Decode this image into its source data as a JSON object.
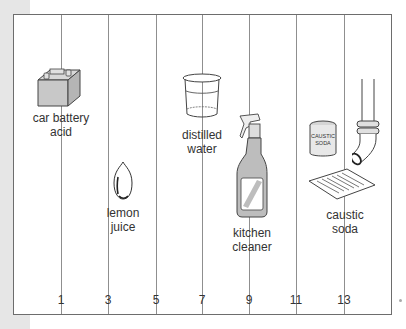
{
  "scale": {
    "ticks": [
      "1",
      "3",
      "5",
      "7",
      "9",
      "11",
      "13"
    ],
    "tick_x": [
      60,
      107,
      155,
      201,
      248,
      295,
      343
    ]
  },
  "items": [
    {
      "name": "car-battery-acid",
      "icon": "battery-icon",
      "label_line1": "car battery",
      "label_line2": "acid",
      "ph": 1
    },
    {
      "name": "lemon-juice",
      "icon": "lemon-icon",
      "label_line1": "lemon",
      "label_line2": "juice",
      "ph": 3
    },
    {
      "name": "distilled-water",
      "icon": "beaker-icon",
      "label_line1": "distilled",
      "label_line2": "water",
      "ph": 7
    },
    {
      "name": "kitchen-cleaner",
      "icon": "spray-bottle-icon",
      "label_line1": "kitchen",
      "label_line2": "cleaner",
      "ph": 9.5
    },
    {
      "name": "caustic-soda",
      "icon": "drain-pipe-icon",
      "label_line1": "caustic",
      "label_line2": "soda",
      "ph": 13,
      "can_text_line1": "CAUSTIC",
      "can_text_line2": "SODA"
    }
  ],
  "colors": {
    "border": "#6d6d6d",
    "grid": "#8f8f8f",
    "icon_fill": "#c8c8c8",
    "text": "#333333"
  }
}
